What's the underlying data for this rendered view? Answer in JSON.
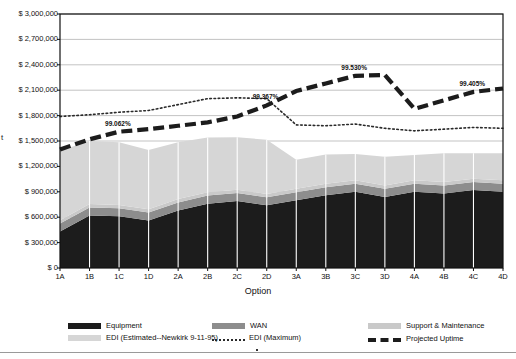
{
  "chart_data": {
    "type": "area",
    "title": "",
    "xlabel": "Option",
    "ylabel": "t",
    "categories": [
      "1A",
      "1B",
      "1C",
      "1D",
      "2A",
      "2B",
      "2C",
      "2D",
      "3A",
      "3B",
      "3C",
      "3D",
      "4A",
      "4B",
      "4C",
      "4D"
    ],
    "ylim": [
      0,
      3000000
    ],
    "ytick_labels": [
      "$ 0",
      "$ 300,000",
      "$ 600,000",
      "$ 900,000",
      "$ 1,200,000",
      "$ 1,500,000",
      "$ 1,800,000",
      "$ 2,100,000",
      "$ 2,400,000",
      "$ 2,700,000",
      "$ 3,000,000"
    ],
    "ytick_values": [
      0,
      300000,
      600000,
      900000,
      1200000,
      1500000,
      1800000,
      2100000,
      2400000,
      2700000,
      3000000
    ],
    "grid": true,
    "legend_position": "bottom",
    "series": [
      {
        "name": "Equipment",
        "stack": true,
        "color": "#1c1c1c",
        "values": [
          430000,
          620000,
          610000,
          560000,
          680000,
          760000,
          790000,
          740000,
          800000,
          860000,
          900000,
          840000,
          900000,
          880000,
          920000,
          900000
        ]
      },
      {
        "name": "WAN",
        "stack": true,
        "color": "#8d8d8d",
        "values": [
          95000,
          95000,
          95000,
          95000,
          95000,
          95000,
          95000,
          95000,
          95000,
          95000,
          95000,
          95000,
          95000,
          95000,
          95000,
          95000
        ]
      },
      {
        "name": "Support & Maintenance",
        "stack": true,
        "color": "#c9c9c9",
        "values": [
          40000,
          40000,
          40000,
          40000,
          40000,
          40000,
          40000,
          40000,
          40000,
          40000,
          40000,
          40000,
          40000,
          40000,
          40000,
          40000
        ]
      },
      {
        "name": "EDI (Estimated--Newkirk 9-11-95)",
        "stack": true,
        "color": "#d6d6d6",
        "values": [
          820000,
          745000,
          740000,
          700000,
          670000,
          645000,
          620000,
          640000,
          345000,
          345000,
          310000,
          340000,
          300000,
          340000,
          300000,
          320000
        ]
      },
      {
        "name": "EDI (Maximum)",
        "stack": false,
        "style": "dotted",
        "color": "#2a2a2a",
        "values": [
          1790000,
          1810000,
          1840000,
          1860000,
          1930000,
          2000000,
          2010000,
          2000000,
          1690000,
          1680000,
          1700000,
          1650000,
          1620000,
          1640000,
          1660000,
          1650000
        ]
      },
      {
        "name": "Projected Uptime",
        "stack": false,
        "style": "dashed",
        "color": "#1c1c1c",
        "values": [
          1400000,
          1520000,
          1610000,
          1640000,
          1680000,
          1720000,
          1790000,
          1920000,
          2090000,
          2180000,
          2270000,
          2280000,
          1880000,
          1980000,
          2080000,
          2120000
        ]
      }
    ],
    "annotations": [
      {
        "label": "99.062%",
        "category": "1C",
        "value": 1610000
      },
      {
        "label": "99.367%",
        "category": "2D",
        "value": 1920000
      },
      {
        "label": "99.530%",
        "category": "3C",
        "value": 2270000
      },
      {
        "label": "99.405%",
        "category": "4C",
        "value": 2080000
      }
    ]
  },
  "legend": {
    "items": [
      {
        "label": "Equipment",
        "marker": "swatch-dark"
      },
      {
        "label": "WAN",
        "marker": "swatch-mid"
      },
      {
        "label": "Support & Maintenance",
        "marker": "swatch-light"
      },
      {
        "label": "EDI (Estimated--Newkirk 9-11-95)",
        "marker": "swatch-light2"
      },
      {
        "label": "EDI (Maximum)",
        "marker": "dotted-line"
      },
      {
        "label": "Projected Uptime",
        "marker": "dashed-line"
      }
    ]
  },
  "colors": {
    "equipment": "#1c1c1c",
    "wan": "#8d8d8d",
    "support": "#c9c9c9",
    "edi_estimated": "#d6d6d6",
    "edi_maximum": "#2a2a2a",
    "projected_uptime": "#1c1c1c",
    "grid": "#b4b4b4",
    "axis": "#111111",
    "separator": "#ffffff"
  }
}
